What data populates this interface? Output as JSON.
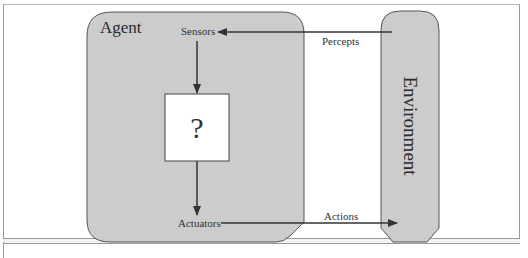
{
  "diagram": {
    "agent": {
      "label": "Agent"
    },
    "environment": {
      "label": "Environment"
    },
    "sensors": {
      "label": "Sensors"
    },
    "actuators": {
      "label": "Actuators"
    },
    "unknown_box": {
      "label": "?"
    },
    "percepts": {
      "label": "Percepts"
    },
    "actions": {
      "label": "Actions"
    }
  },
  "colors": {
    "box_fill": "#cccccc",
    "box_stroke": "#555555",
    "arrow": "#333333",
    "background": "#ffffff"
  }
}
